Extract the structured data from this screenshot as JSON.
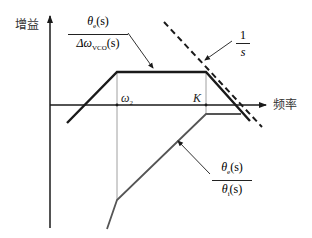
{
  "axes": {
    "y_label": "增益",
    "x_label": "频率"
  },
  "markers": {
    "omega2": {
      "symbol": "ω",
      "subscript": "2"
    },
    "K": "K"
  },
  "curves": [
    {
      "id": "open_loop_transfer",
      "label_num": {
        "symbol": "θ",
        "subscript": "e",
        "arg": "(s)"
      },
      "label_den": {
        "prefix": "Δω",
        "subscript": "VCO",
        "arg": "(s)"
      },
      "description": "rising slope, flat between ω2 and K, falling slope"
    },
    {
      "id": "integrator",
      "label_num": "1",
      "label_den": "s",
      "style": "dashed"
    },
    {
      "id": "error_transfer",
      "label_num": {
        "symbol": "θ",
        "subscript": "e",
        "arg": "(s)"
      },
      "label_den": {
        "symbol": "θ",
        "subscript": "i",
        "arg": "(s)"
      },
      "description": "rising from below, breaks at ω2, flattens at K"
    }
  ],
  "colors": {
    "line": "#1a1a1a",
    "guide": "#888888",
    "background": "#ffffff"
  }
}
